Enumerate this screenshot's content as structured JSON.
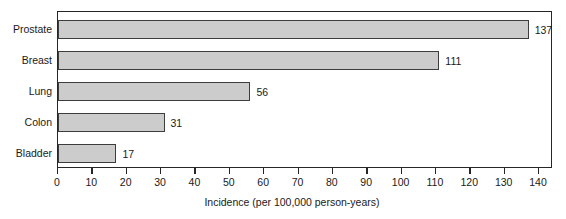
{
  "chart_data": {
    "type": "bar",
    "orientation": "horizontal",
    "title": "",
    "subtitle": "",
    "xlabel": "Incidence (per 100,000 person-years)",
    "ylabel": "",
    "categories": [
      "Prostate",
      "Breast",
      "Lung",
      "Colon",
      "Bladder"
    ],
    "values": [
      137,
      111,
      56,
      31,
      17
    ],
    "value_labels": [
      "137",
      "111",
      "56",
      "31",
      "17"
    ],
    "xlim": [
      0,
      143
    ],
    "xticks": [
      0,
      10,
      20,
      30,
      40,
      50,
      60,
      70,
      80,
      90,
      100,
      110,
      120,
      130,
      140
    ],
    "xtick_labels": [
      "0",
      "10",
      "20",
      "30",
      "40",
      "50",
      "60",
      "70",
      "80",
      "90",
      "100",
      "110",
      "120",
      "130",
      "140"
    ],
    "grid": false,
    "legend": null,
    "legend_position": "none",
    "colors": {
      "bar_fill": "#cccccc",
      "bar_border": "#3d3d3d",
      "axis": "#262626",
      "text": "#1a1a1a",
      "background": "#ffffff"
    }
  }
}
